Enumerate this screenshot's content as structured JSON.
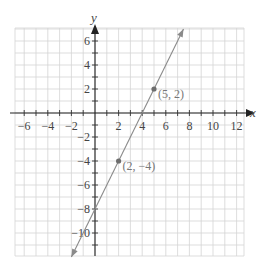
{
  "chart_data": {
    "type": "line",
    "title": "",
    "xlabel": "x",
    "ylabel": "y",
    "xlim": [
      -6.7,
      12.4
    ],
    "ylim": [
      -11.9,
      7
    ],
    "grid": true,
    "x_ticks": [
      -6,
      -4,
      -2,
      2,
      4,
      6,
      8,
      10,
      12
    ],
    "y_ticks": [
      6,
      4,
      2,
      -2,
      -4,
      -6,
      -8,
      -10
    ],
    "series": [
      {
        "name": "line",
        "equation": "y = 2x - 8",
        "slope": 2,
        "intercept": -8,
        "x": [
          -2,
          7.5
        ],
        "y": [
          -12,
          7
        ],
        "color": "#8a8a8a"
      }
    ],
    "points": [
      {
        "x": 5,
        "y": 2,
        "label": "(5, 2)"
      },
      {
        "x": 2,
        "y": -4,
        "label": "(2, −4)"
      }
    ]
  },
  "labels": {
    "x_axis": "x",
    "y_axis": "y",
    "point_a": "(5, 2)",
    "point_b": "(2, −4)"
  }
}
